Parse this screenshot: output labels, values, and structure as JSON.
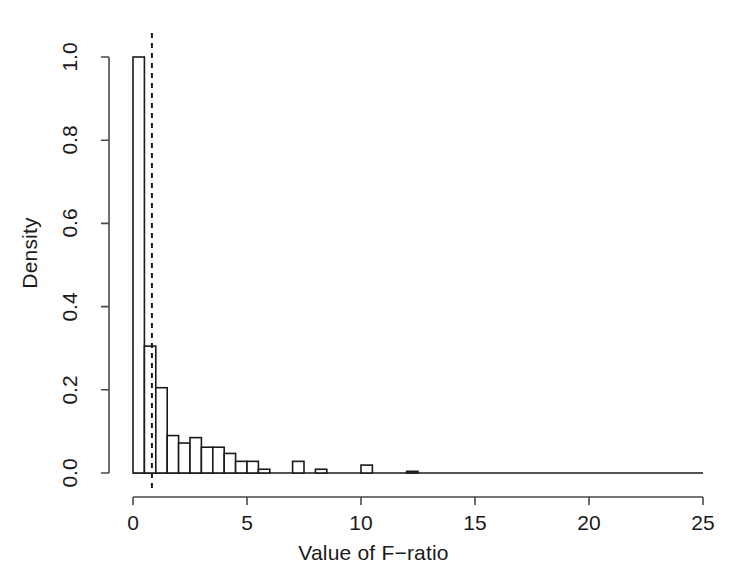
{
  "chart_data": {
    "type": "bar",
    "subtype": "histogram",
    "title": "",
    "subtitle": "",
    "xlabel": "Value of F−ratio",
    "ylabel": "Density",
    "xlim": [
      0,
      25
    ],
    "ylim": [
      0.0,
      1.0
    ],
    "grid": false,
    "legend": null,
    "bin_width": 0.5,
    "x_ticks": [
      0,
      5,
      10,
      15,
      20,
      25
    ],
    "x_tick_labels": [
      "0",
      "5",
      "10",
      "15",
      "20",
      "25"
    ],
    "y_ticks": [
      0.0,
      0.2,
      0.4,
      0.6,
      0.8,
      1.0
    ],
    "y_tick_labels": [
      "0.0",
      "0.2",
      "0.4",
      "0.6",
      "0.8",
      "1.0"
    ],
    "bar_fill": "#ffffff",
    "bar_stroke": "#1a1a1a",
    "axis_color": "#4a4a4a",
    "bin_starts": [
      0.0,
      0.5,
      1.0,
      1.5,
      2.0,
      2.5,
      3.0,
      3.5,
      4.0,
      4.5,
      5.0,
      5.5,
      6.0,
      6.5,
      7.0,
      7.5,
      8.0,
      8.5,
      9.0,
      9.5,
      10.0,
      10.5,
      11.0,
      11.5,
      12.0,
      12.5
    ],
    "values": [
      1.0,
      0.305,
      0.205,
      0.09,
      0.072,
      0.085,
      0.062,
      0.062,
      0.047,
      0.028,
      0.028,
      0.009,
      0.0,
      0.0,
      0.028,
      0.0,
      0.009,
      0.0,
      0.0,
      0.0,
      0.019,
      0.0,
      0.0,
      0.0,
      0.004,
      0.0
    ],
    "annotations": [
      {
        "name": "critical-value-line",
        "type": "vline",
        "x": 0.83,
        "style": "dashed",
        "color": "#1a1a1a"
      }
    ]
  },
  "figure": {
    "background": "#ffffff"
  }
}
